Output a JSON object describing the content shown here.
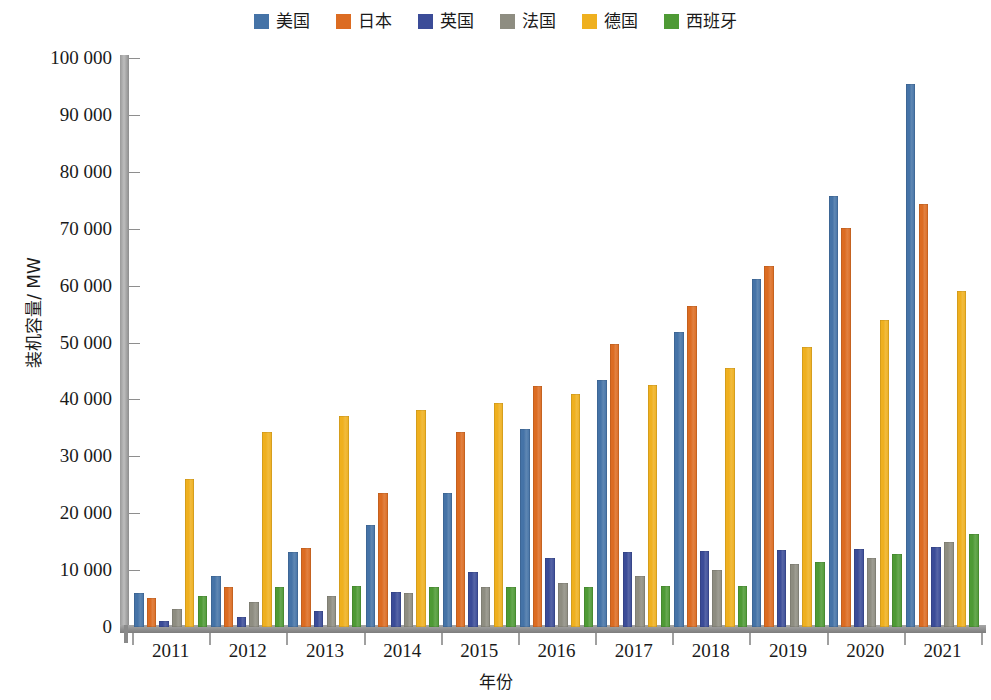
{
  "chart_data": {
    "type": "bar",
    "title": "",
    "xlabel": "年份",
    "ylabel": "装机容量/ MW",
    "categories": [
      "2011",
      "2012",
      "2013",
      "2014",
      "2015",
      "2016",
      "2017",
      "2018",
      "2019",
      "2020",
      "2021"
    ],
    "ylim": [
      0,
      100000
    ],
    "ytick_labels": [
      "0",
      "10 000",
      "20 000",
      "30 000",
      "40 000",
      "50 000",
      "60 000",
      "70 000",
      "80 000",
      "90 000",
      "100 000"
    ],
    "ytick_values": [
      0,
      10000,
      20000,
      30000,
      40000,
      50000,
      60000,
      70000,
      80000,
      90000,
      100000
    ],
    "ytick_step": 10000,
    "grid": false,
    "legend_position": "top-center",
    "series": [
      {
        "name": "美国",
        "color": "#4573a7",
        "values": [
          6000,
          9000,
          13200,
          17900,
          23600,
          34800,
          43400,
          51800,
          61200,
          75800,
          95400
        ]
      },
      {
        "name": "日本",
        "color": "#dc6c22",
        "values": [
          5100,
          7000,
          13800,
          23600,
          34200,
          42300,
          49800,
          56400,
          63500,
          70100,
          74400
        ]
      },
      {
        "name": "英国",
        "color": "#3b4c98",
        "values": [
          1100,
          1800,
          2900,
          6200,
          9700,
          12100,
          13100,
          13300,
          13500,
          13700,
          14100
        ]
      },
      {
        "name": "法国",
        "color": "#8e8d81",
        "values": [
          3100,
          4400,
          5500,
          5900,
          7100,
          7800,
          8900,
          10000,
          11100,
          12200,
          15000
        ]
      },
      {
        "name": "德国",
        "color": "#efb01f",
        "values": [
          26000,
          34200,
          37000,
          38200,
          39400,
          41000,
          42500,
          45500,
          49200,
          54000,
          59000
        ]
      },
      {
        "name": "西班牙",
        "color": "#4e9a35",
        "values": [
          5500,
          7000,
          7200,
          7100,
          7100,
          7100,
          7200,
          7200,
          11500,
          12900,
          16300
        ]
      }
    ]
  }
}
